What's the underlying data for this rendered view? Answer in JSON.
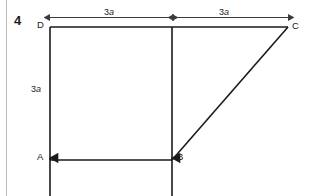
{
  "question": {
    "number": "4"
  },
  "figure": {
    "type": "structural-frame-diagram",
    "nodes": [
      {
        "id": "A",
        "label": "A",
        "x": 50,
        "y": 160
      },
      {
        "id": "B",
        "label": "B",
        "x": 172,
        "y": 160
      },
      {
        "id": "C",
        "label": "C",
        "x": 288,
        "y": 27
      },
      {
        "id": "D",
        "label": "D",
        "x": 50,
        "y": 27
      }
    ],
    "members": [
      {
        "from": "A",
        "to": "D"
      },
      {
        "from": "D",
        "to": "C"
      },
      {
        "from": "A",
        "to": "B"
      },
      {
        "from": "B",
        "to": "C"
      },
      {
        "from": "B",
        "to": "D"
      }
    ],
    "dimensions": [
      {
        "id": "top-left",
        "label": "3a",
        "coefficient": "3",
        "symbol": "a",
        "from": "D",
        "to": "B",
        "orientation": "horizontal"
      },
      {
        "id": "top-right",
        "label": "3a",
        "coefficient": "3",
        "symbol": "a",
        "from": "B",
        "to": "C",
        "orientation": "horizontal"
      },
      {
        "id": "left-vertical",
        "label": "3a",
        "coefficient": "3",
        "symbol": "a",
        "from": "A",
        "to": "D",
        "orientation": "vertical"
      }
    ],
    "supports": [
      {
        "at": "A",
        "type": "upward-reaction-arrow"
      },
      {
        "at": "B",
        "type": "upward-reaction-arrow"
      }
    ],
    "colors": {
      "line": "#1a1a1a",
      "dimension_line": "#3c3c3c",
      "margin_rule": "#b9b9b9",
      "background": "#ffffff"
    }
  }
}
